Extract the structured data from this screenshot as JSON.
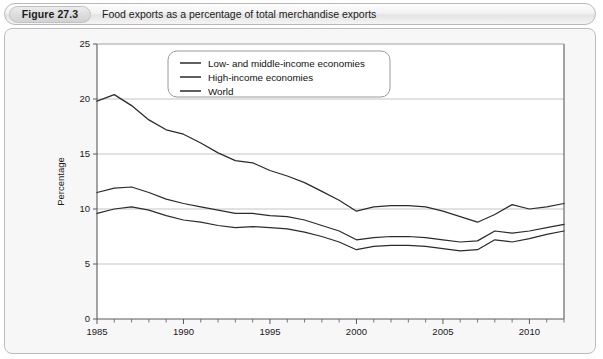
{
  "figure": {
    "badge": "Figure 27.3",
    "caption": "Food exports as a percentage of total merchandise exports"
  },
  "chart_data": {
    "type": "line",
    "title": "Food exports as a percentage of total merchandise exports",
    "xlabel": "",
    "ylabel": "Percentage",
    "xlim": [
      1985,
      2012
    ],
    "ylim": [
      0,
      25
    ],
    "yticks": [
      0,
      5,
      10,
      15,
      20,
      25
    ],
    "xticks": [
      1985,
      1990,
      1995,
      2000,
      2005,
      2010
    ],
    "xtick_labels": [
      "1985",
      "1990",
      "1995",
      "2000",
      "2005",
      "2010"
    ],
    "ytick_labels": [
      "0",
      "5",
      "10",
      "15",
      "20",
      "25"
    ],
    "minor_xticks_every": 1,
    "grid": "horizontal",
    "legend_position": "top-center",
    "x": [
      1985,
      1986,
      1987,
      1988,
      1989,
      1990,
      1991,
      1992,
      1993,
      1994,
      1995,
      1996,
      1997,
      1998,
      1999,
      2000,
      2001,
      2002,
      2003,
      2004,
      2005,
      2006,
      2007,
      2008,
      2009,
      2010,
      2011,
      2012
    ],
    "series": [
      {
        "name": "Low- and middle-income economies",
        "color": "#2b2b2b",
        "values": [
          19.8,
          20.4,
          19.4,
          18.1,
          17.2,
          16.8,
          16.0,
          15.1,
          14.4,
          14.2,
          13.5,
          13.0,
          12.4,
          11.6,
          10.8,
          9.8,
          10.2,
          10.3,
          10.3,
          10.2,
          9.8,
          9.3,
          8.8,
          9.5,
          10.4,
          10.0,
          10.2,
          10.5
        ]
      },
      {
        "name": "High-income economies",
        "color": "#2b2b2b",
        "values": [
          9.6,
          10.0,
          10.2,
          9.9,
          9.4,
          9.0,
          8.8,
          8.5,
          8.3,
          8.4,
          8.3,
          8.2,
          7.9,
          7.5,
          7.0,
          6.3,
          6.6,
          6.7,
          6.7,
          6.6,
          6.4,
          6.2,
          6.3,
          7.2,
          7.0,
          7.3,
          7.7,
          8.0
        ]
      },
      {
        "name": "World",
        "color": "#2b2b2b",
        "values": [
          11.5,
          11.9,
          12.0,
          11.5,
          10.9,
          10.5,
          10.2,
          9.9,
          9.6,
          9.6,
          9.4,
          9.3,
          9.0,
          8.5,
          8.0,
          7.2,
          7.4,
          7.5,
          7.5,
          7.4,
          7.2,
          7.0,
          7.1,
          8.0,
          7.8,
          8.0,
          8.3,
          8.6
        ]
      }
    ]
  }
}
